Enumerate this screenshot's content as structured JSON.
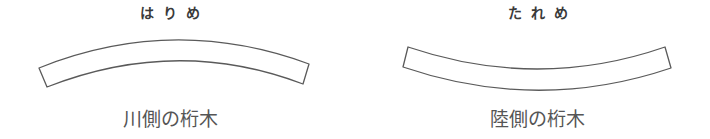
{
  "panels": [
    {
      "heading": "はりめ",
      "caption": "川側の桁木",
      "shape": {
        "type": "beam-curved-up",
        "top_edge": {
          "start": [
            39,
            68
          ],
          "control": [
            173,
            14
          ],
          "end": [
            309,
            64
          ]
        },
        "bottom_edge": {
          "start": [
            47,
            87
          ],
          "control": [
            177,
            36
          ],
          "end": [
            303,
            84
          ]
        }
      }
    },
    {
      "heading": "たれめ",
      "caption": "陸側の桁木",
      "shape": {
        "type": "beam-curved-down",
        "top_edge": {
          "start": [
            408,
            47
          ],
          "control": [
            538,
            91
          ],
          "end": [
            665,
            47
          ]
        },
        "bottom_edge": {
          "start": [
            403,
            67
          ],
          "control": [
            538,
            113
          ],
          "end": [
            671,
            68
          ]
        }
      }
    }
  ],
  "colors": {
    "stroke": "#5a5a5a",
    "heading_text": "#3a3a3a",
    "caption_text": "#555555",
    "background": "#ffffff"
  }
}
